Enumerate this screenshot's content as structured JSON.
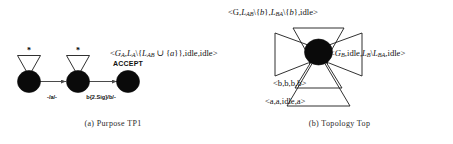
{
  "figure": {
    "panels": [
      {
        "id": "purpose-tp1",
        "caption": "(a) Purpose TP1",
        "states": [
          {
            "id": "s0",
            "loop_label": "*",
            "accept": false
          },
          {
            "id": "s1",
            "loop_label": "*",
            "accept": false
          },
          {
            "id": "s2",
            "loop_label": "",
            "accept": true
          }
        ],
        "accept_label": "ACCEPT",
        "transitions": [
          {
            "from": "s0",
            "to": "s1",
            "label": "-/a/-"
          },
          {
            "from": "s1",
            "to": "s2",
            "label": "b{2.Sig}/b/-"
          }
        ]
      },
      {
        "id": "topology-top",
        "caption": "(b) Topology Top",
        "center_node": "top",
        "self_loops": [
          {
            "position": "top",
            "label": "<G,L_AB\\{b},L_BA\\{b},idle>",
            "parts": [
              "<G,",
              "L",
              "AB",
              "\\{b},",
              "L",
              "BA",
              "\\{b},idle>"
            ]
          },
          {
            "position": "left",
            "label": "<G_A,L_A\\{L_AB ∪ {a}},idle,idle>",
            "parts": [
              "<G",
              "A",
              ",L",
              "A",
              "\\{L",
              "AB",
              " ∪ {a}},idle,idle>"
            ]
          },
          {
            "position": "right",
            "label": "<G_B,idle,L_B\\L_BA,idle>",
            "parts": [
              "<G",
              "B",
              ",idle,L",
              "B",
              "\\L",
              "BA",
              ",idle>"
            ]
          },
          {
            "position": "bottom-inner",
            "label": "<b,b,b,b>"
          },
          {
            "position": "bottom-outer",
            "label": "<a,a,idle,a>"
          }
        ]
      }
    ]
  },
  "colors": {
    "node": "#0a0a0a",
    "stroke": "#1a1a1a",
    "edge": "#4a4a4a",
    "text": "#111111",
    "background": "#ffffff"
  }
}
